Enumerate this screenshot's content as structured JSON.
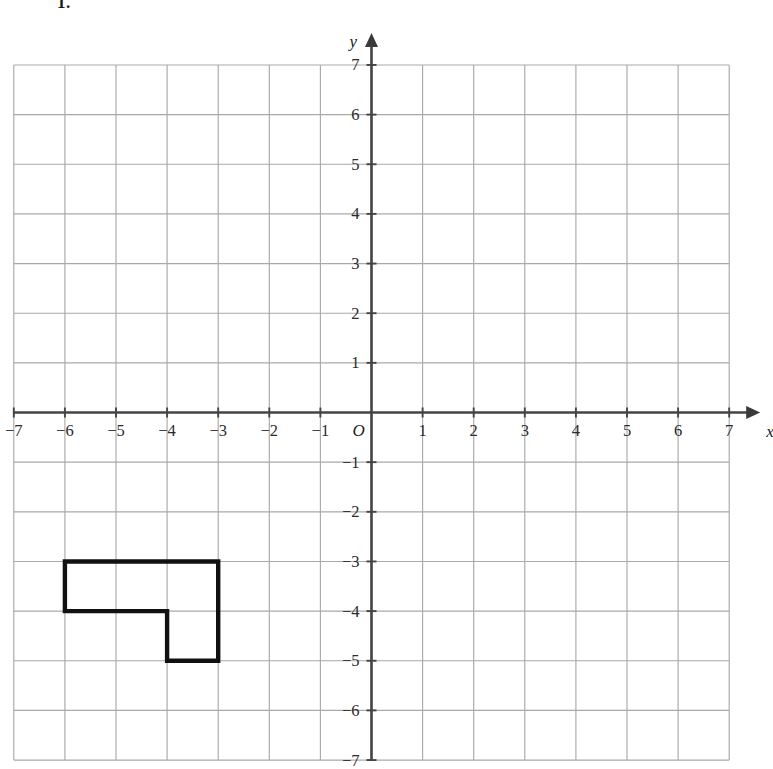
{
  "question": {
    "number": "1."
  },
  "chart_data": {
    "type": "scatter",
    "title": "",
    "xlabel": "x",
    "ylabel": "y",
    "grid": true,
    "legend": false,
    "xlim": [
      -7,
      7
    ],
    "ylim": [
      -7,
      7
    ],
    "x_tick_step": 1,
    "y_tick_step": 1,
    "origin_label": "O",
    "x_tick_labels": [
      "−7",
      "−6",
      "−5",
      "−4",
      "−3",
      "−2",
      "−1",
      "1",
      "2",
      "3",
      "4",
      "5",
      "6",
      "7"
    ],
    "x_tick_values": [
      -7,
      -6,
      -5,
      -4,
      -3,
      -2,
      -1,
      1,
      2,
      3,
      4,
      5,
      6,
      7
    ],
    "y_tick_labels": [
      "7",
      "6",
      "5",
      "4",
      "3",
      "2",
      "1",
      "−1",
      "−2",
      "−3",
      "−4",
      "−5",
      "−6",
      "−7"
    ],
    "y_tick_values": [
      7,
      6,
      5,
      4,
      3,
      2,
      1,
      -1,
      -2,
      -3,
      -4,
      -5,
      -6,
      -7
    ],
    "x_axis_arrow": "positive",
    "y_axis_arrow": "positive",
    "shapes": [
      {
        "name": "L-shape",
        "type": "polygon",
        "closed": true,
        "stroke": "#111111",
        "fill": "none",
        "vertices": [
          [
            -6,
            -3
          ],
          [
            -3,
            -3
          ],
          [
            -3,
            -5
          ],
          [
            -4,
            -5
          ],
          [
            -4,
            -4
          ],
          [
            -6,
            -4
          ]
        ]
      }
    ],
    "colors": {
      "grid": "#a9a9a9",
      "axis": "#444444",
      "shape_stroke": "#111111",
      "background": "#ffffff"
    }
  }
}
